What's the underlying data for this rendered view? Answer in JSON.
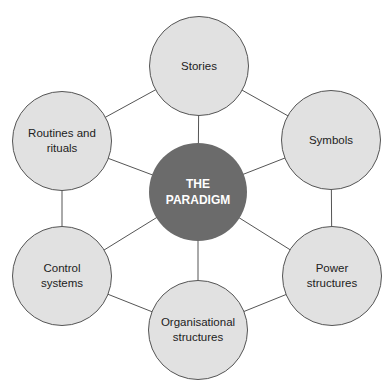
{
  "diagram": {
    "center": {
      "label": "THE\nPARADIGM",
      "x": 198,
      "y": 192,
      "r": 49,
      "fill": "#6b6b6b"
    },
    "nodes": [
      {
        "id": "stories",
        "label": "Stories",
        "x": 199,
        "y": 66,
        "r": 50
      },
      {
        "id": "symbols",
        "label": "Symbols",
        "x": 331,
        "y": 140,
        "r": 50
      },
      {
        "id": "power",
        "label": "Power\nstructures",
        "x": 332,
        "y": 276,
        "r": 50
      },
      {
        "id": "organisational",
        "label": "Organisational\nstructures",
        "x": 198,
        "y": 330,
        "r": 50
      },
      {
        "id": "control",
        "label": "Control\nsystems",
        "x": 62,
        "y": 276,
        "r": 50
      },
      {
        "id": "routines",
        "label": "Routines and\nrituals",
        "x": 62,
        "y": 141,
        "r": 50
      }
    ],
    "colors": {
      "outer_fill": "#e1e1e1",
      "outline": "#555555",
      "line": "#555555"
    }
  }
}
